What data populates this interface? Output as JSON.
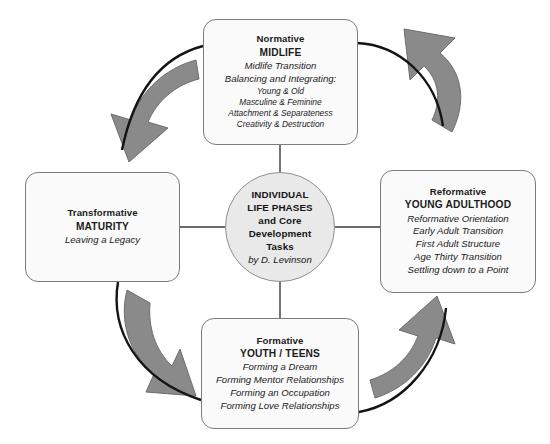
{
  "diagram": {
    "title": "Individual Life Phases and Core Development Tasks",
    "colors": {
      "background": "#ffffff",
      "box_fill": "#fafafa",
      "box_border": "#7c7c7c",
      "hub_fill": "#e9e9e9",
      "hub_border": "#8d8d8d",
      "arrow_fill": "#8a8a8a",
      "arrow_stroke": "#6e6e6e",
      "inner_curve": "#141414",
      "connector_line": "#3a3a3a",
      "text": "#1a1a1a"
    }
  },
  "hub": {
    "lines": [
      "INDIVIDUAL",
      "LIFE PHASES",
      "and Core",
      "Development",
      "Tasks"
    ],
    "author": "by D. Levinson"
  },
  "phases": {
    "midlife": {
      "kicker": "Normative",
      "name": "MIDLIFE",
      "tasks": [
        "Midlife Transition",
        "Balancing and Integrating:"
      ],
      "subtasks": [
        "Young & Old",
        "Masculine & Feminine",
        "Attachment & Separateness",
        "Creativity & Destruction"
      ]
    },
    "young_adulthood": {
      "kicker": "Reformative",
      "name": "YOUNG ADULTHOOD",
      "tasks": [
        "Reformative Orientation",
        "Early Adult Transition",
        "First Adult Structure",
        "Age Thirty Transition",
        "Settling down to a Point"
      ],
      "subtasks": []
    },
    "youth": {
      "kicker": "Formative",
      "name": "YOUTH / TEENS",
      "tasks": [
        "Forming a Dream",
        "Forming Mentor Relationships",
        "Forming an Occupation",
        "Forming Love Relationships"
      ],
      "subtasks": []
    },
    "maturity": {
      "kicker": "Transformative",
      "name": "MATURITY",
      "tasks": [
        "Leaving a Legacy"
      ],
      "subtasks": []
    }
  },
  "arrows": [
    {
      "id": "midlife-to-maturity",
      "from": "midlife",
      "to": "maturity",
      "quadrant": "top-left"
    },
    {
      "id": "maturity-to-youth",
      "from": "maturity",
      "to": "youth",
      "quadrant": "bottom-left"
    },
    {
      "id": "youth-to-young-adulthood",
      "from": "youth",
      "to": "young_adulthood",
      "quadrant": "bottom-right"
    },
    {
      "id": "young-adulthood-to-midlife",
      "from": "young_adulthood",
      "to": "midlife",
      "quadrant": "top-right"
    }
  ],
  "connectors": [
    {
      "id": "hub-to-midlife",
      "target": "midlife"
    },
    {
      "id": "hub-to-young-adulthood",
      "target": "young_adulthood"
    },
    {
      "id": "hub-to-youth",
      "target": "youth"
    },
    {
      "id": "hub-to-maturity",
      "target": "maturity"
    }
  ]
}
